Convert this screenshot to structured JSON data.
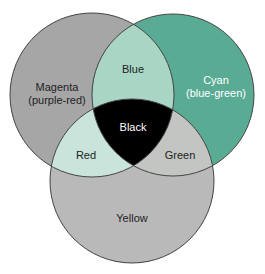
{
  "diagram": {
    "type": "venn",
    "circles": [
      {
        "id": "magenta",
        "label_line1": "Magenta",
        "label_line2": "(purple-red)",
        "cx": 92,
        "cy": 95,
        "r": 82,
        "color": "#a6a6a6"
      },
      {
        "id": "cyan",
        "label_line1": "Cyan",
        "label_line2": "(blue-green)",
        "cx": 173,
        "cy": 95,
        "r": 81,
        "color": "#5aab94"
      },
      {
        "id": "yellow",
        "label_line1": "Yellow",
        "cx": 132,
        "cy": 181,
        "r": 82,
        "color": "#b9b9b9"
      }
    ],
    "overlaps": {
      "magenta_cyan": {
        "label": "Blue",
        "color": "#a9d5c5"
      },
      "magenta_yellow": {
        "label": "Red",
        "color": "#c9e5db"
      },
      "cyan_yellow": {
        "label": "Green",
        "color": "#c3c5c3"
      },
      "all": {
        "label": "Black",
        "color": "#000000"
      }
    },
    "outline_color": "#444444"
  }
}
